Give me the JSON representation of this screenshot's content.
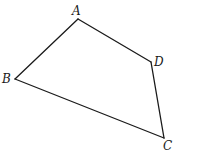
{
  "diagram": {
    "type": "quadrilateral",
    "stroke_color": "#1a1a1a",
    "background": "#ffffff",
    "vertices": [
      {
        "name": "A",
        "x": 78,
        "y": 19,
        "label_x": 72,
        "label_y": 16
      },
      {
        "name": "D",
        "x": 151,
        "y": 62,
        "label_x": 154,
        "label_y": 66
      },
      {
        "name": "C",
        "x": 164,
        "y": 138,
        "label_x": 163,
        "label_y": 150
      },
      {
        "name": "B",
        "x": 15,
        "y": 79,
        "label_x": 2,
        "label_y": 83
      }
    ],
    "edges": [
      {
        "from": "A",
        "to": "D"
      },
      {
        "from": "D",
        "to": "C"
      },
      {
        "from": "C",
        "to": "B"
      },
      {
        "from": "B",
        "to": "A"
      }
    ],
    "labels": {
      "A": "A",
      "B": "B",
      "C": "C",
      "D": "D"
    }
  }
}
